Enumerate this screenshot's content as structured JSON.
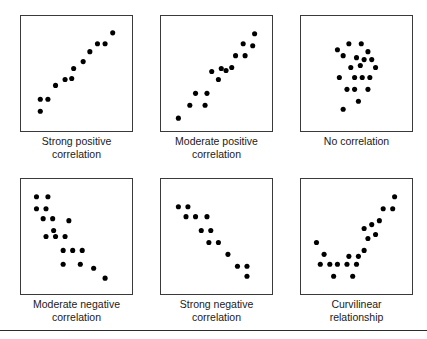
{
  "figure": {
    "background_color": "#ffffff",
    "panel_border_color": "#3a3a3a",
    "point_color": "#000000",
    "rule_color": "#2b2b2b",
    "caption_color": "#1a1a1a"
  },
  "panels": [
    {
      "id": "strong-positive",
      "caption_line1": "Strong positive",
      "caption_line2": "correlation",
      "left": 20,
      "top": 15
    },
    {
      "id": "moderate-positive",
      "caption_line1": "Moderate positive",
      "caption_line2": "correlation",
      "left": 160,
      "top": 15
    },
    {
      "id": "no-correlation",
      "caption_line1": "No correlation",
      "caption_line2": "",
      "left": 300,
      "top": 15
    },
    {
      "id": "moderate-negative",
      "caption_line1": "Moderate negative",
      "caption_line2": "correlation",
      "left": 20,
      "top": 178
    },
    {
      "id": "strong-negative",
      "caption_line1": "Strong negative",
      "caption_line2": "correlation",
      "left": 160,
      "top": 178
    },
    {
      "id": "curvilinear",
      "caption_line1": "Curvilinear",
      "caption_line2": "relationship",
      "left": 300,
      "top": 178
    }
  ],
  "chart_data": [
    {
      "type": "scatter",
      "title": "Strong positive correlation",
      "xlabel": "",
      "ylabel": "",
      "xlim": [
        0,
        100
      ],
      "ylim": [
        0,
        100
      ],
      "grid": false,
      "legend": "none",
      "points": [
        [
          12,
          12
        ],
        [
          12,
          24
        ],
        [
          20,
          24
        ],
        [
          28,
          38
        ],
        [
          38,
          44
        ],
        [
          45,
          45
        ],
        [
          47,
          55
        ],
        [
          57,
          62
        ],
        [
          64,
          72
        ],
        [
          72,
          80
        ],
        [
          80,
          80
        ],
        [
          88,
          91
        ]
      ]
    },
    {
      "type": "scatter",
      "title": "Moderate positive correlation",
      "xlabel": "",
      "ylabel": "",
      "xlim": [
        0,
        100
      ],
      "ylim": [
        0,
        100
      ],
      "grid": false,
      "legend": "none",
      "points": [
        [
          10,
          5
        ],
        [
          22,
          18
        ],
        [
          28,
          30
        ],
        [
          38,
          18
        ],
        [
          40,
          30
        ],
        [
          45,
          52
        ],
        [
          52,
          44
        ],
        [
          55,
          55
        ],
        [
          60,
          53
        ],
        [
          66,
          56
        ],
        [
          70,
          68
        ],
        [
          80,
          68
        ],
        [
          78,
          80
        ],
        [
          88,
          78
        ],
        [
          90,
          90
        ]
      ]
    },
    {
      "type": "scatter",
      "title": "No correlation",
      "xlabel": "",
      "ylabel": "",
      "xlim": [
        0,
        100
      ],
      "ylim": [
        0,
        100
      ],
      "grid": false,
      "legend": "none",
      "points": [
        [
          30,
          74
        ],
        [
          42,
          80
        ],
        [
          55,
          80
        ],
        [
          62,
          72
        ],
        [
          36,
          68
        ],
        [
          50,
          66
        ],
        [
          58,
          64
        ],
        [
          66,
          64
        ],
        [
          44,
          56
        ],
        [
          54,
          58
        ],
        [
          70,
          56
        ],
        [
          32,
          46
        ],
        [
          48,
          46
        ],
        [
          56,
          46
        ],
        [
          64,
          46
        ],
        [
          40,
          34
        ],
        [
          48,
          34
        ],
        [
          62,
          34
        ],
        [
          52,
          22
        ],
        [
          36,
          14
        ]
      ]
    },
    {
      "type": "scatter",
      "title": "Moderate negative correlation",
      "xlabel": "",
      "ylabel": "",
      "xlim": [
        0,
        100
      ],
      "ylim": [
        0,
        100
      ],
      "grid": false,
      "legend": "none",
      "points": [
        [
          8,
          90
        ],
        [
          20,
          90
        ],
        [
          8,
          78
        ],
        [
          18,
          78
        ],
        [
          15,
          68
        ],
        [
          25,
          68
        ],
        [
          42,
          66
        ],
        [
          26,
          56
        ],
        [
          18,
          50
        ],
        [
          28,
          50
        ],
        [
          38,
          50
        ],
        [
          36,
          36
        ],
        [
          46,
          36
        ],
        [
          56,
          36
        ],
        [
          36,
          22
        ],
        [
          54,
          22
        ],
        [
          68,
          18
        ],
        [
          80,
          8
        ]
      ]
    },
    {
      "type": "scatter",
      "title": "Strong negative correlation",
      "xlabel": "",
      "ylabel": "",
      "xlim": [
        0,
        100
      ],
      "ylim": [
        0,
        100
      ],
      "grid": false,
      "legend": "none",
      "points": [
        [
          10,
          80
        ],
        [
          20,
          80
        ],
        [
          18,
          70
        ],
        [
          28,
          70
        ],
        [
          40,
          70
        ],
        [
          34,
          56
        ],
        [
          44,
          56
        ],
        [
          42,
          44
        ],
        [
          52,
          44
        ],
        [
          62,
          32
        ],
        [
          72,
          20
        ],
        [
          82,
          20
        ],
        [
          82,
          10
        ]
      ]
    },
    {
      "type": "scatter",
      "title": "Curvilinear relationship",
      "xlabel": "",
      "ylabel": "",
      "xlim": [
        0,
        100
      ],
      "ylim": [
        0,
        100
      ],
      "grid": false,
      "legend": "none",
      "points": [
        [
          8,
          44
        ],
        [
          16,
          32
        ],
        [
          12,
          22
        ],
        [
          22,
          22
        ],
        [
          30,
          22
        ],
        [
          40,
          22
        ],
        [
          26,
          10
        ],
        [
          46,
          10
        ],
        [
          42,
          30
        ],
        [
          52,
          30
        ],
        [
          50,
          22
        ],
        [
          58,
          36
        ],
        [
          62,
          48
        ],
        [
          70,
          52
        ],
        [
          58,
          58
        ],
        [
          66,
          62
        ],
        [
          74,
          66
        ],
        [
          78,
          78
        ],
        [
          88,
          78
        ],
        [
          90,
          90
        ]
      ]
    }
  ]
}
